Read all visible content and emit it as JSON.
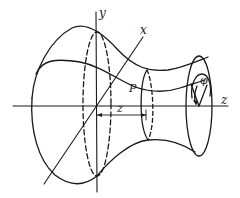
{
  "figure": {
    "labels": {
      "y_axis": "y",
      "x_axis": "x",
      "z_axis": "z",
      "point": "P",
      "distance": "z",
      "angle": "φ"
    },
    "colors": {
      "ink": "#1a1a1a",
      "background": "#ffffff"
    }
  }
}
